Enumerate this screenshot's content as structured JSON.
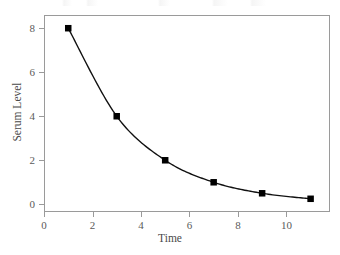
{
  "chart_data": {
    "type": "line",
    "title": "",
    "xlabel": "Time",
    "ylabel": "Serum Level",
    "xlim": [
      0,
      11.8
    ],
    "ylim": [
      -0.35,
      8.6
    ],
    "xticks": [
      0,
      2,
      4,
      6,
      8,
      10
    ],
    "xtick_labels": [
      "0",
      "2",
      "4",
      "6",
      "8",
      "10"
    ],
    "yticks": [
      0,
      2,
      4,
      6,
      8
    ],
    "ytick_labels": [
      "0",
      "2",
      "4",
      "6",
      "8"
    ],
    "grid": false,
    "legend": null,
    "marker": "square",
    "marker_color": "#000000",
    "line_color": "#111111",
    "axis_color": "#9a9a9a",
    "text_color": "#4a4a4a",
    "x": [
      1,
      3,
      5,
      7,
      9,
      11
    ],
    "values": [
      8,
      4,
      2,
      1,
      0.5,
      0.25
    ],
    "series": [
      {
        "name": "Serum Level",
        "x": [
          1,
          3,
          5,
          7,
          9,
          11
        ],
        "values": [
          8,
          4,
          2,
          1,
          0.5,
          0.25
        ]
      }
    ],
    "points": [
      {
        "x": 1,
        "y": 8
      },
      {
        "x": 3,
        "y": 4
      },
      {
        "x": 5,
        "y": 2
      },
      {
        "x": 7,
        "y": 1
      },
      {
        "x": 9,
        "y": 0.5
      },
      {
        "x": 11,
        "y": 0.25
      }
    ],
    "annotations": []
  }
}
